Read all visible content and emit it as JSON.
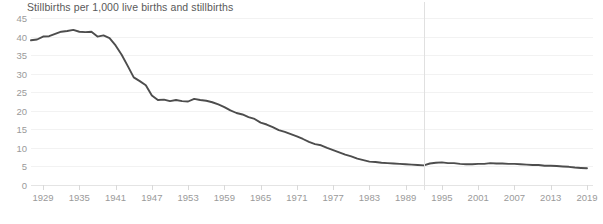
{
  "chart": {
    "title": "Stillbirths per 1,000 live births and stillbirths",
    "line_color": "#4d4d4d",
    "gridline_color": "#f2f2f2",
    "axis_color": "#e4e4e4",
    "tick_label_color": "#9a9a9a",
    "title_color": "#595959",
    "break_line_color": "#e0e0e0"
  },
  "chart_data": {
    "type": "line",
    "title": "Stillbirths per 1,000 live births and stillbirths",
    "xlabel": "",
    "ylabel": "",
    "xlim": [
      1927,
      2020
    ],
    "ylim": [
      0,
      45
    ],
    "grid": true,
    "legend": "none",
    "yticks": [
      0,
      5,
      10,
      15,
      20,
      25,
      30,
      35,
      40,
      45
    ],
    "xticks": [
      1929,
      1935,
      1941,
      1947,
      1953,
      1959,
      1965,
      1971,
      1977,
      1983,
      1989,
      1995,
      2001,
      2007,
      2013,
      2019
    ],
    "annotations": [
      {
        "type": "vertical-line",
        "x": 1992,
        "label": ""
      }
    ],
    "series": [
      {
        "name": "Stillbirth rate",
        "x": [
          1927,
          1928,
          1929,
          1930,
          1931,
          1932,
          1933,
          1934,
          1935,
          1936,
          1937,
          1938,
          1939,
          1940,
          1941,
          1942,
          1943,
          1944,
          1945,
          1946,
          1947,
          1948,
          1949,
          1950,
          1951,
          1952,
          1953,
          1954,
          1955,
          1956,
          1957,
          1958,
          1959,
          1960,
          1961,
          1962,
          1963,
          1964,
          1965,
          1966,
          1967,
          1968,
          1969,
          1970,
          1971,
          1972,
          1973,
          1974,
          1975,
          1976,
          1977,
          1978,
          1979,
          1980,
          1981,
          1982,
          1983,
          1984,
          1985,
          1986,
          1987,
          1988,
          1989,
          1990,
          1991,
          1992,
          1993,
          1994,
          1995,
          1996,
          1997,
          1998,
          1999,
          2000,
          2001,
          2002,
          2003,
          2004,
          2005,
          2006,
          2007,
          2008,
          2009,
          2010,
          2011,
          2012,
          2013,
          2014,
          2015,
          2016,
          2017,
          2018,
          2019
        ],
        "values": [
          39.0,
          39.2,
          40.0,
          40.1,
          40.7,
          41.3,
          41.5,
          41.8,
          41.3,
          41.2,
          41.3,
          40.0,
          40.3,
          39.6,
          37.6,
          35.1,
          32.1,
          29.0,
          28.0,
          26.9,
          24.1,
          22.9,
          23.0,
          22.6,
          22.9,
          22.6,
          22.5,
          23.2,
          22.9,
          22.7,
          22.3,
          21.7,
          21.0,
          20.1,
          19.4,
          19.0,
          18.3,
          17.8,
          16.8,
          16.3,
          15.6,
          14.8,
          14.3,
          13.7,
          13.1,
          12.4,
          11.6,
          11.0,
          10.7,
          10.0,
          9.4,
          8.8,
          8.2,
          7.7,
          7.1,
          6.7,
          6.3,
          6.2,
          6.0,
          5.9,
          5.8,
          5.7,
          5.6,
          5.5,
          5.4,
          5.3,
          5.8,
          6.0,
          6.1,
          5.9,
          5.9,
          5.7,
          5.6,
          5.6,
          5.7,
          5.7,
          5.9,
          5.8,
          5.8,
          5.7,
          5.7,
          5.6,
          5.5,
          5.4,
          5.4,
          5.2,
          5.2,
          5.1,
          5.0,
          4.9,
          4.7,
          4.6,
          4.5
        ]
      }
    ]
  }
}
